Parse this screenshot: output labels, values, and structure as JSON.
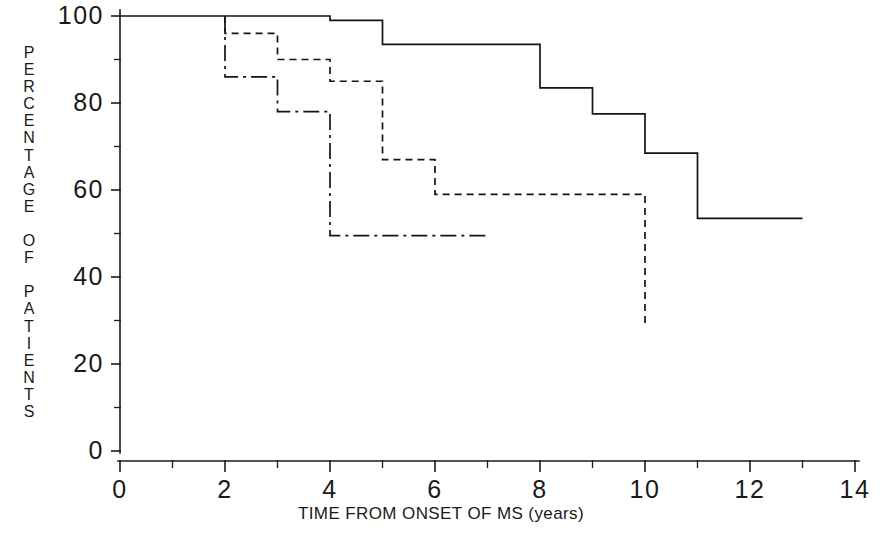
{
  "chart_data": {
    "type": "line",
    "title": "",
    "subtitle": "",
    "xlabel": "TIME FROM ONSET OF MS (years)",
    "ylabel": "PERCENTAGE OF PATIENTS",
    "ylabel_letters": [
      "P",
      "E",
      "R",
      "C",
      "E",
      "N",
      "T",
      "A",
      "G",
      "E",
      "",
      "O",
      "F",
      "",
      "P",
      "A",
      "T",
      "I",
      "E",
      "N",
      "T",
      "S"
    ],
    "xlim": [
      0,
      14
    ],
    "ylim": [
      0,
      100
    ],
    "xticks": [
      0,
      2,
      4,
      6,
      8,
      10,
      12,
      14
    ],
    "xticklabels": [
      "0",
      "2",
      "4",
      "6",
      "8",
      "10",
      "12",
      "14"
    ],
    "xminor_ticks": [
      1,
      3,
      5,
      7,
      9,
      11,
      13
    ],
    "yticks": [
      0,
      20,
      40,
      60,
      80,
      100
    ],
    "yticklabels": [
      "0",
      "20",
      "40",
      "60",
      "80",
      "100"
    ],
    "yminor_ticks": [
      10,
      30,
      50,
      70,
      90
    ],
    "grid": false,
    "legend": false,
    "legend_position": "none",
    "step_type": "post",
    "series": [
      {
        "name": "solid-curve",
        "linestyle": "solid",
        "color": "#141414",
        "x": [
          0,
          4,
          4,
          5,
          5,
          8,
          8,
          9,
          9,
          10,
          10,
          11,
          11,
          13
        ],
        "y": [
          100,
          100,
          99,
          99,
          93.5,
          93.5,
          83.5,
          83.5,
          77.5,
          77.5,
          68.5,
          68.5,
          53.5,
          53.5
        ],
        "points": [
          {
            "x": 0,
            "y": 100
          },
          {
            "x": 4,
            "y": 99
          },
          {
            "x": 5,
            "y": 93.5
          },
          {
            "x": 8,
            "y": 83.5
          },
          {
            "x": 9,
            "y": 77.5
          },
          {
            "x": 10,
            "y": 68.5
          },
          {
            "x": 11,
            "y": 53.5
          },
          {
            "x": 13,
            "y": 53.5
          }
        ]
      },
      {
        "name": "dashed-curve",
        "linestyle": "dashed",
        "color": "#141414",
        "x": [
          2,
          2,
          3,
          3,
          4,
          4,
          5,
          5,
          6,
          6,
          10,
          10
        ],
        "y": [
          100,
          96,
          96,
          90,
          90,
          85,
          85,
          67,
          67,
          59,
          59,
          29
        ],
        "points": [
          {
            "x": 2,
            "y": 96
          },
          {
            "x": 3,
            "y": 90
          },
          {
            "x": 4,
            "y": 85
          },
          {
            "x": 5,
            "y": 67
          },
          {
            "x": 6,
            "y": 59
          },
          {
            "x": 10,
            "y": 29
          }
        ]
      },
      {
        "name": "dash-dot-curve",
        "linestyle": "dashdot",
        "color": "#141414",
        "x": [
          2,
          2,
          3,
          3,
          4,
          4,
          7
        ],
        "y": [
          100,
          86,
          86,
          78,
          78,
          49.5,
          49.5
        ],
        "points": [
          {
            "x": 2,
            "y": 86
          },
          {
            "x": 3,
            "y": 78
          },
          {
            "x": 4,
            "y": 49.5
          },
          {
            "x": 7,
            "y": 49.5
          }
        ]
      }
    ]
  },
  "geometry": {
    "x0_px": 120,
    "x_per_unit_px": 52.5,
    "y0_px": 451,
    "y_per_unit_px": 4.35
  }
}
